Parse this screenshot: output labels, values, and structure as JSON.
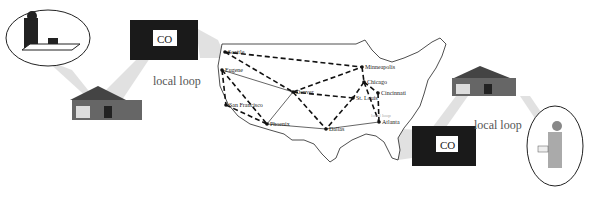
{
  "diagram": {
    "type": "telephone-network-illustration",
    "labels": {
      "local_loop_left": "local loop",
      "local_loop_right": "local loop",
      "local_loop_map": "local loop",
      "co_left": "CO",
      "co_right": "CO"
    },
    "cities": [
      {
        "name": "Seattle",
        "x": 225,
        "y": 52
      },
      {
        "name": "Eugene",
        "x": 222,
        "y": 70
      },
      {
        "name": "San Francisco",
        "x": 226,
        "y": 105
      },
      {
        "name": "Phoenix",
        "x": 267,
        "y": 124
      },
      {
        "name": "Denver",
        "x": 293,
        "y": 92
      },
      {
        "name": "Dallas",
        "x": 326,
        "y": 129
      },
      {
        "name": "Minneapolis",
        "x": 362,
        "y": 67
      },
      {
        "name": "Chicago",
        "x": 364,
        "y": 82
      },
      {
        "name": "St. Louis",
        "x": 353,
        "y": 98
      },
      {
        "name": "Cincinnati",
        "x": 378,
        "y": 93
      },
      {
        "name": "Atlanta",
        "x": 379,
        "y": 122
      }
    ],
    "links_solid": [
      [
        "Eugene",
        "Denver"
      ],
      [
        "Denver",
        "Phoenix"
      ],
      [
        "Phoenix",
        "Dallas"
      ],
      [
        "Dallas",
        "Atlanta"
      ]
    ],
    "links_dashed": [
      [
        "Seattle",
        "Minneapolis"
      ],
      [
        "Seattle",
        "Denver"
      ],
      [
        "Eugene",
        "San Francisco"
      ],
      [
        "Eugene",
        "Phoenix"
      ],
      [
        "San Francisco",
        "Phoenix"
      ],
      [
        "Denver",
        "Minneapolis"
      ],
      [
        "Denver",
        "St. Louis"
      ],
      [
        "Denver",
        "Dallas"
      ],
      [
        "St. Louis",
        "Dallas"
      ],
      [
        "Chicago",
        "St. Louis"
      ],
      [
        "Chicago",
        "Cincinnati"
      ],
      [
        "Chicago",
        "Atlanta"
      ],
      [
        "Cincinnati",
        "Atlanta"
      ],
      [
        "Minneapolis",
        "Chicago"
      ]
    ],
    "colors": {
      "line": "#111111",
      "callout": "#d9d9d9",
      "building": "#1a1a1a"
    }
  }
}
